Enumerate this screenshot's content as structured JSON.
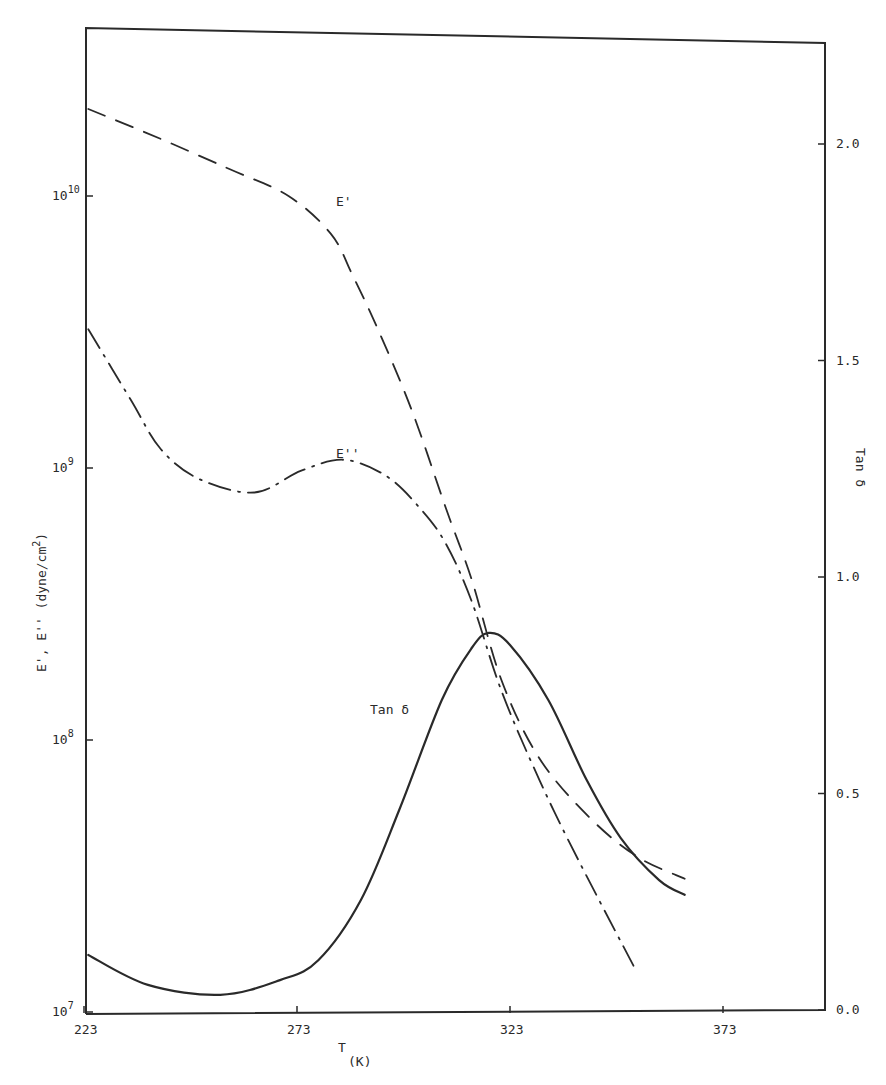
{
  "chart_data": {
    "type": "line",
    "title": "",
    "xlabel": "T",
    "xlabel_sub": "(K)",
    "ylabel": "E', E'' (dyne/cm²)",
    "ylabel_right": "Tan δ",
    "xlim": [
      223,
      395
    ],
    "ylim": [
      10000000,
      30000000000
    ],
    "yscale": "log",
    "ylim_right": [
      0.0,
      2.25
    ],
    "grid": false,
    "legend": "inline curve labels",
    "x_ticks": [
      223,
      273,
      323,
      373
    ],
    "x_tick_labels": [
      "223",
      "273",
      "323",
      "373"
    ],
    "y_ticks": [
      7,
      8,
      9,
      10
    ],
    "y_tick_labels": [
      "10",
      "10",
      "10",
      "10"
    ],
    "y_tick_exponents": [
      "7",
      "8",
      "9",
      "10"
    ],
    "y_right_ticks": [
      0.0,
      0.5,
      1.0,
      1.5,
      2.0
    ],
    "y_right_tick_labels": [
      "0.0",
      "0.5",
      "1.0",
      "1.5",
      "2.0"
    ],
    "series": [
      {
        "name": "E'",
        "label": "E'",
        "axis": "left",
        "style": "dashed",
        "x": [
          224,
          241,
          257,
          271,
          281,
          286,
          292,
          300,
          308,
          314,
          321,
          330,
          342,
          353,
          364
        ],
        "log10_values": [
          10.32,
          10.21,
          10.1,
          10.0,
          9.86,
          9.71,
          9.51,
          9.21,
          8.85,
          8.59,
          8.22,
          7.93,
          7.71,
          7.57,
          7.49
        ]
      },
      {
        "name": "E''",
        "label": "E''",
        "axis": "left",
        "style": "dash-dot",
        "x": [
          224,
          234,
          241,
          250,
          263,
          274,
          284,
          294,
          302,
          308,
          314,
          321,
          330,
          339,
          352
        ],
        "log10_values": [
          9.51,
          9.25,
          9.07,
          8.96,
          8.91,
          8.99,
          9.03,
          8.97,
          8.85,
          8.72,
          8.51,
          8.18,
          7.85,
          7.56,
          7.17
        ]
      },
      {
        "name": "Tan δ",
        "label": "Tan δ",
        "axis": "right",
        "style": "solid",
        "x": [
          224,
          238,
          255,
          269,
          278,
          288,
          297,
          307,
          314,
          318,
          323,
          332,
          341,
          349,
          358,
          364
        ],
        "values": [
          0.127,
          0.058,
          0.035,
          0.069,
          0.115,
          0.254,
          0.462,
          0.716,
          0.836,
          0.871,
          0.843,
          0.716,
          0.531,
          0.397,
          0.3,
          0.266
        ]
      }
    ],
    "annotations": [
      {
        "text": "E'",
        "x": 285,
        "log10_y": 10.0
      },
      {
        "text": "E''",
        "x": 285,
        "log10_y": 9.07
      },
      {
        "text": "Tan δ",
        "x": 290,
        "y_right": 0.8
      }
    ]
  },
  "labels": {
    "x_axis": "T",
    "x_axis_sub": "(K)",
    "y_axis_left": "E', E'' (dyne/cm",
    "y_axis_left_sup": "2",
    "y_axis_left_close": ")",
    "y_axis_right": "Tan δ",
    "curve_e_prime": "E'",
    "curve_e_double_prime": "E''",
    "curve_tan_delta": "Tan δ"
  }
}
